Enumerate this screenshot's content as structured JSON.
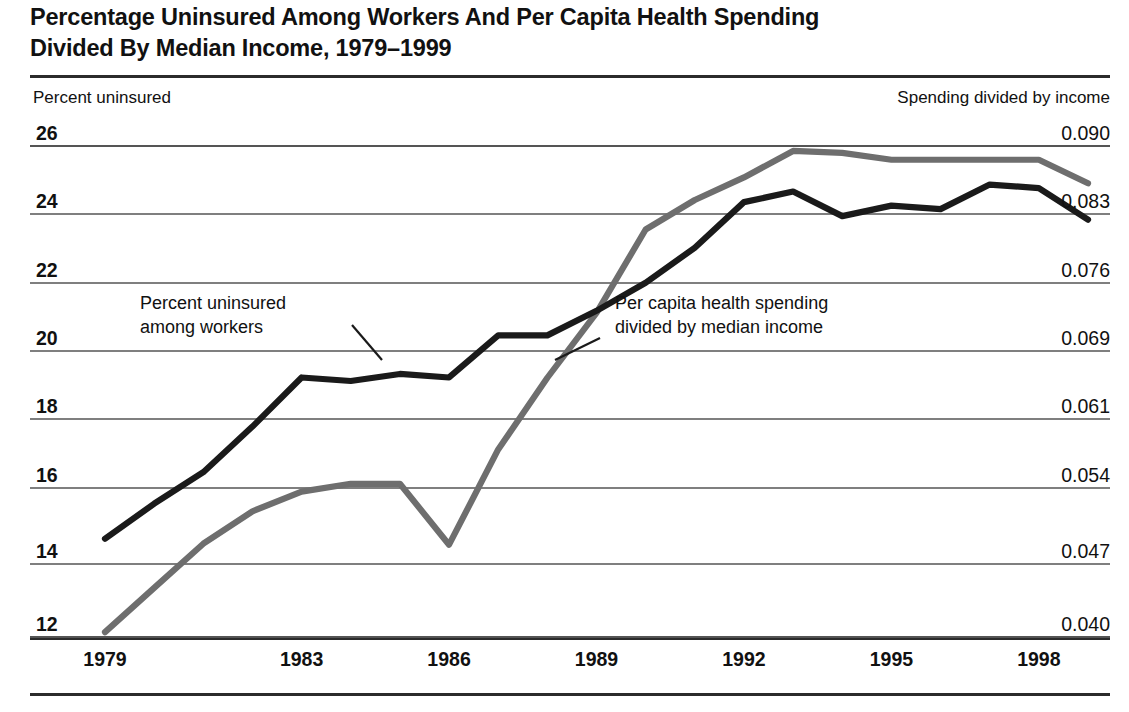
{
  "title": {
    "line1": "Percentage Uninsured Among Workers And Per Capita Health Spending",
    "line2": "Divided By Median Income, 1979–1999"
  },
  "axis_captions": {
    "left": "Percent uninsured",
    "right": "Spending divided by income"
  },
  "annotations": {
    "black": {
      "line1": "Percent uninsured",
      "line2": "among workers"
    },
    "gray": {
      "line1": "Per capita health spending",
      "line2": "divided by median income"
    }
  },
  "colors": {
    "black_series": "#1a1a1a",
    "gray_series": "#6e6e6e",
    "gridline": "#555555",
    "rule": "#2b2b2b",
    "background": "#ffffff"
  },
  "chart_data": {
    "type": "line",
    "title": "Percentage Uninsured Among Workers And Per Capita Health Spending Divided By Median Income, 1979–1999",
    "xlabel": "",
    "ylabel": "Percent uninsured",
    "y2label": "Spending divided by income",
    "grid": true,
    "legend": "annotations-inline",
    "xlim": [
      1979,
      1999
    ],
    "x": [
      1979,
      1980,
      1981,
      1982,
      1983,
      1984,
      1985,
      1986,
      1987,
      1988,
      1989,
      1990,
      1991,
      1992,
      1993,
      1994,
      1995,
      1996,
      1997,
      1998,
      1999
    ],
    "xticks": [
      1979,
      1983,
      1986,
      1989,
      1992,
      1995,
      1998
    ],
    "xticklabels": [
      "1979",
      "1983",
      "1986",
      "1989",
      "1992",
      "1995",
      "1998"
    ],
    "left_axis": {
      "label": "Percent uninsured",
      "ylim": [
        12,
        26
      ],
      "ticks": [
        26,
        24,
        22,
        20,
        18,
        16,
        14,
        12
      ],
      "ticklabels": [
        "26",
        "24",
        "22",
        "20",
        "18",
        "16",
        "14",
        "12"
      ]
    },
    "right_axis": {
      "label": "Spending divided by income",
      "ylim": [
        0.04,
        0.09
      ],
      "ticks": [
        0.09,
        0.083,
        0.076,
        0.069,
        0.061,
        0.054,
        0.047,
        0.04
      ],
      "ticklabels": [
        "0.090",
        "0.083",
        "0.076",
        "0.069",
        "0.061",
        "0.054",
        "0.047",
        "0.040"
      ]
    },
    "series": [
      {
        "name": "Percent uninsured among workers",
        "axis": "left",
        "color": "#1a1a1a",
        "values": [
          14.8,
          15.8,
          16.7,
          18.0,
          19.4,
          19.3,
          19.5,
          19.4,
          20.6,
          20.6,
          21.3,
          22.1,
          23.1,
          24.4,
          24.7,
          24.0,
          24.3,
          24.2,
          24.9,
          24.8,
          23.9
        ]
      },
      {
        "name": "Per capita health spending divided by median income",
        "axis": "right",
        "color": "#6e6e6e",
        "values": [
          0.0405,
          0.045,
          0.0495,
          0.0528,
          0.0548,
          0.0556,
          0.0556,
          0.0494,
          0.0591,
          0.0664,
          0.073,
          0.0815,
          0.0845,
          0.0868,
          0.0895,
          0.0893,
          0.0886,
          0.0886,
          0.0886,
          0.0886,
          0.0862
        ]
      }
    ]
  }
}
